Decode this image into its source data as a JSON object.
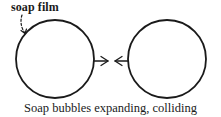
{
  "diagram": {
    "annotation_label": "soap film",
    "caption": "Soap bubbles expanding, colliding",
    "colors": {
      "stroke": "#1a1a1a",
      "background": "#ffffff"
    },
    "elements": [
      {
        "id": "bubble-left",
        "shape": "circle",
        "cx": 55,
        "cy": 59,
        "r": 39
      },
      {
        "id": "bubble-right",
        "shape": "circle",
        "cx": 167,
        "cy": 59,
        "r": 39
      },
      {
        "id": "arrow-right",
        "shape": "arrow",
        "direction": "right",
        "from": [
          94,
          61
        ],
        "to": [
          108,
          61
        ]
      },
      {
        "id": "arrow-left",
        "shape": "arrow",
        "direction": "left",
        "from": [
          129,
          61
        ],
        "to": [
          115,
          61
        ]
      },
      {
        "id": "film-pointer",
        "shape": "dashed-arrow",
        "from": [
          23,
          15
        ],
        "to": [
          25,
          33
        ]
      }
    ]
  }
}
